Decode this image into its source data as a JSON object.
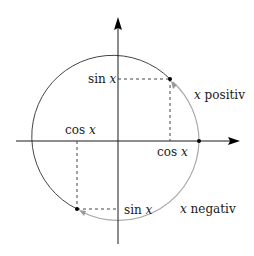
{
  "diagram": {
    "colors": {
      "axis": "#1a1a1a",
      "circle_dark": "#444444",
      "arc_light": "#aaaaaa",
      "dashed": "#444444",
      "point": "#000000"
    },
    "labels": {
      "sin_top": "sin",
      "sin_top_var": "x",
      "cos_right": "cos",
      "cos_right_var": "x",
      "cos_left": "cos",
      "cos_left_var": "x",
      "sin_bottom": "sin",
      "sin_bottom_var": "x",
      "x_positive_var": "x",
      "x_positive": "positiv",
      "x_negative_var": "x",
      "x_negative": "negativ"
    },
    "geometry": {
      "center": [
        118,
        141
      ],
      "radius": 81,
      "point_positive": [
        170,
        79
      ],
      "point_negative": [
        77,
        209
      ],
      "point_start": [
        199,
        141
      ]
    }
  }
}
